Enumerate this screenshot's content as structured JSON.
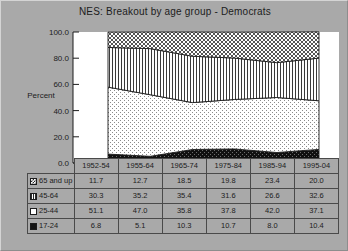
{
  "chart_data": {
    "type": "area",
    "title": "NES:  Breakout by age group - Democrats",
    "xlabel": "",
    "ylabel": "Percent",
    "ylim": [
      0.0,
      100.0
    ],
    "yticks": [
      "0.0",
      "20.0",
      "40.0",
      "60.0",
      "80.0",
      "100.0"
    ],
    "grid": true,
    "stacked": true,
    "legend_position": "table-left",
    "categories": [
      "1952-54",
      "1955-64",
      "1965-74",
      "1975-84",
      "1985-94",
      "1995-04"
    ],
    "series": [
      {
        "name": "65 and up",
        "pattern": "checker",
        "values": [
          11.7,
          12.7,
          18.5,
          19.8,
          23.4,
          20.0
        ]
      },
      {
        "name": "45-64",
        "pattern": "vstripe",
        "values": [
          30.3,
          35.2,
          35.4,
          31.6,
          26.6,
          32.6
        ]
      },
      {
        "name": "25-44",
        "pattern": "dots",
        "values": [
          51.1,
          47.0,
          35.8,
          37.8,
          42.0,
          37.1
        ]
      },
      {
        "name": "17-24",
        "pattern": "solid",
        "values": [
          6.8,
          5.1,
          10.3,
          10.7,
          8.0,
          10.4
        ]
      }
    ],
    "stack_order_bottom_to_top": [
      "17-24",
      "25-44",
      "45-64",
      "65 and up"
    ]
  },
  "table": {
    "corner_label": "",
    "column_headers": [
      "1952-54",
      "1955-64",
      "1965-74",
      "1975-84",
      "1985-94",
      "1995-04"
    ],
    "rows": [
      {
        "label": "65 and up",
        "swatch": "checker-swatch",
        "values": [
          "11.7",
          "12.7",
          "18.5",
          "19.8",
          "23.4",
          "20.0"
        ]
      },
      {
        "label": "45-64",
        "swatch": "vstripe-swatch",
        "values": [
          "30.3",
          "35.2",
          "35.4",
          "31.6",
          "26.6",
          "32.6"
        ]
      },
      {
        "label": "25-44",
        "swatch": "white-swatch",
        "values": [
          "51.1",
          "47.0",
          "35.8",
          "37.8",
          "42.0",
          "37.1"
        ]
      },
      {
        "label": "17-24",
        "swatch": "solid-swatch",
        "values": [
          "6.8",
          "5.1",
          "10.3",
          "10.7",
          "8.0",
          "10.4"
        ]
      }
    ]
  },
  "colors": {
    "background": "#a9a9a9",
    "plot_background": "#ffffff",
    "ink": "#1c1c1c",
    "grid": "#4a4a4a"
  }
}
